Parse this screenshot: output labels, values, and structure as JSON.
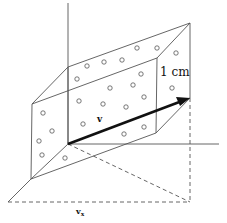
{
  "diagram": {
    "labels": {
      "length": "1 cm",
      "vector": "v",
      "projection": "v",
      "projection_subscript": "x"
    },
    "colors": {
      "line": "#555555",
      "vector": "#111111",
      "background": "#ffffff"
    },
    "particle_count": 23
  }
}
